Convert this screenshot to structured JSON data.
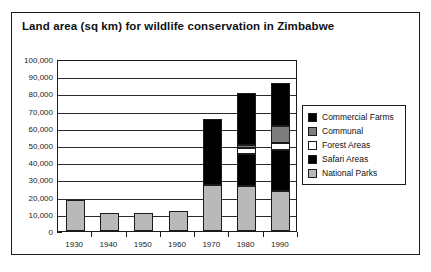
{
  "figure": {
    "title": "Land area (sq km) for wildlife conservation in Zimbabwe"
  },
  "chart_data": {
    "type": "bar",
    "stacked": true,
    "title": "Land area (sq km) for wildlife conservation in Zimbabwe",
    "xlabel": "",
    "ylabel": "",
    "ylim": [
      0,
      100000
    ],
    "ytick_labels": [
      "100,000",
      "90,000",
      "80,000",
      "70,000",
      "60,000",
      "50,000",
      "40,000",
      "30,000",
      "20,000",
      "10,000",
      "0"
    ],
    "ytick_values": [
      100000,
      90000,
      80000,
      70000,
      60000,
      50000,
      40000,
      30000,
      20000,
      10000,
      0
    ],
    "grid": true,
    "legend_position": "right",
    "categories": [
      "1930",
      "1940",
      "1950",
      "1960",
      "1970",
      "1980",
      "1990"
    ],
    "series": [
      {
        "name": "National Parks",
        "color": "#b9b9b9",
        "values": [
          18000,
          10500,
          10500,
          11500,
          27000,
          26000,
          23000
        ]
      },
      {
        "name": "Safari Areas",
        "color": "#000000",
        "values": [
          0,
          0,
          0,
          0,
          38000,
          19000,
          24000
        ]
      },
      {
        "name": "Forest Areas",
        "color": "#ffffff",
        "values": [
          0,
          0,
          0,
          0,
          0,
          3000,
          4000
        ]
      },
      {
        "name": "Communal",
        "color": "#7d7d7d",
        "values": [
          0,
          0,
          0,
          0,
          0,
          2000,
          10000
        ]
      },
      {
        "name": "Commercial Farms",
        "color": "#000000",
        "values": [
          0,
          0,
          0,
          0,
          0,
          30000,
          25000
        ]
      }
    ],
    "totals": [
      18000,
      10500,
      10500,
      11500,
      65000,
      80000,
      86000
    ]
  },
  "legend": {
    "items": [
      {
        "label": "Commercial Farms",
        "color": "#000000"
      },
      {
        "label": "Communal",
        "color": "#7d7d7d"
      },
      {
        "label": "Forest Areas",
        "color": "#ffffff"
      },
      {
        "label": "Safari Areas",
        "color": "#000000"
      },
      {
        "label": "National Parks",
        "color": "#b9b9b9"
      }
    ]
  }
}
